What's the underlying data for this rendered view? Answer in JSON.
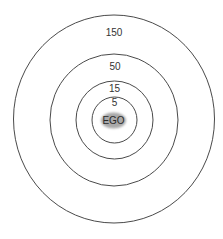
{
  "diagram": {
    "type": "concentric-circles",
    "center": {
      "x": 114,
      "y": 120
    },
    "colors": {
      "stroke": "#4a4a4a",
      "ego_fill": "#a9a9a9",
      "text": "#333333",
      "background": "#ffffff"
    },
    "ego": {
      "label": "EGO",
      "rx": 12.5,
      "ry": 8
    },
    "rings": [
      {
        "label": "5",
        "rx": 22.5,
        "ry": 23,
        "label_y": 103
      },
      {
        "label": "15",
        "rx": 38.5,
        "ry": 39,
        "label_y": 89
      },
      {
        "label": "50",
        "rx": 64,
        "ry": 66,
        "label_y": 67
      },
      {
        "label": "150",
        "rx": 100.5,
        "ry": 104,
        "label_y": 33
      }
    ]
  }
}
